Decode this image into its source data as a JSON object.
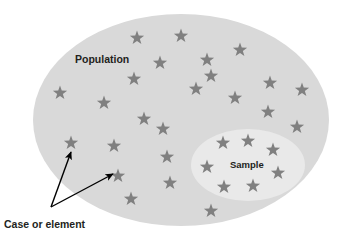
{
  "figure": {
    "type": "population-sample-venn-diagram",
    "background_color": "#ffffff",
    "width": 353,
    "height": 238
  },
  "labels": {
    "population": "Population",
    "sample": "Sample",
    "case_or_element": "Case or element"
  },
  "shapes": {
    "population_ellipse": {
      "name": "Population",
      "fill": "#d9d9d9",
      "cx": 181,
      "cy": 120,
      "rx": 148,
      "ry": 106
    },
    "sample_ellipse": {
      "name": "Sample",
      "fill": "#e9e9e9",
      "cx": 248,
      "cy": 165,
      "rx": 57,
      "ry": 36
    }
  },
  "stars": {
    "fill": "#808080",
    "count": 31,
    "size": 15,
    "points": [
      {
        "x": 137,
        "y": 38
      },
      {
        "x": 181,
        "y": 36
      },
      {
        "x": 240,
        "y": 50
      },
      {
        "x": 160,
        "y": 63
      },
      {
        "x": 207,
        "y": 60
      },
      {
        "x": 134,
        "y": 79
      },
      {
        "x": 211,
        "y": 76
      },
      {
        "x": 196,
        "y": 89
      },
      {
        "x": 60,
        "y": 93
      },
      {
        "x": 270,
        "y": 83
      },
      {
        "x": 302,
        "y": 90
      },
      {
        "x": 235,
        "y": 98
      },
      {
        "x": 104,
        "y": 103
      },
      {
        "x": 268,
        "y": 112
      },
      {
        "x": 144,
        "y": 119
      },
      {
        "x": 163,
        "y": 129
      },
      {
        "x": 297,
        "y": 127
      },
      {
        "x": 71,
        "y": 143
      },
      {
        "x": 114,
        "y": 146
      },
      {
        "x": 167,
        "y": 157
      },
      {
        "x": 223,
        "y": 143
      },
      {
        "x": 248,
        "y": 141
      },
      {
        "x": 273,
        "y": 150
      },
      {
        "x": 207,
        "y": 167
      },
      {
        "x": 278,
        "y": 173
      },
      {
        "x": 118,
        "y": 176
      },
      {
        "x": 170,
        "y": 183
      },
      {
        "x": 224,
        "y": 187
      },
      {
        "x": 253,
        "y": 186
      },
      {
        "x": 131,
        "y": 199
      },
      {
        "x": 211,
        "y": 211
      }
    ]
  },
  "annotations": {
    "arrows": [
      {
        "name": "arrow-to-upper-star",
        "x1": 51,
        "y1": 207,
        "x2": 71,
        "y2": 152
      },
      {
        "name": "arrow-to-lower-star",
        "x1": 51,
        "y1": 207,
        "x2": 113,
        "y2": 174
      }
    ],
    "color": "#000000"
  },
  "label_positions": {
    "population": {
      "x": 75,
      "y": 63
    },
    "sample": {
      "x": 230,
      "y": 168
    },
    "case_or_element": {
      "x": 4,
      "y": 228
    }
  }
}
